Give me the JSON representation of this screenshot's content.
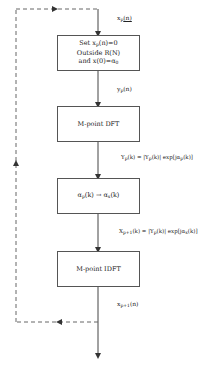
{
  "diagram": {
    "type": "flowchart",
    "boxes": [
      {
        "id": "constraint",
        "lines": [
          "Set x_p(n)=0",
          "Outside R(N)",
          "and x(0)=α_0"
        ]
      },
      {
        "id": "dft",
        "lines": [
          "M-point DFT"
        ]
      },
      {
        "id": "phase",
        "lines": [
          "α_p(k) → α_x(k)"
        ]
      },
      {
        "id": "idft",
        "lines": [
          "M-point IDFT"
        ]
      }
    ],
    "edges": [
      {
        "from": "input",
        "to": "constraint",
        "label": "x_p(n)"
      },
      {
        "from": "constraint",
        "to": "dft",
        "label": "y_p(n)"
      },
      {
        "from": "dft",
        "to": "phase",
        "label": "Y_p(k) = |Y_p(k)| exp[jα_p(k)]"
      },
      {
        "from": "phase",
        "to": "idft",
        "label": "X_{p+1}(k) = |Y_p(k)| exp[jα_x(k)]"
      },
      {
        "from": "idft",
        "to": "output",
        "label": "x_{p+1}(n)"
      },
      {
        "from": "output",
        "to": "input",
        "style": "dashed",
        "label": ""
      }
    ]
  },
  "labels": {
    "box1_line1_pre": "Set x",
    "box1_line1_sub": "p",
    "box1_line1_post": "(n)=0",
    "box1_line2": "Outside R(N)",
    "box1_line3_pre": "and x(0)=α",
    "box1_line3_sub": "0",
    "box2": "M-point DFT",
    "box3_a": "α",
    "box3_a_sub": "p",
    "box3_mid": "(k) → α",
    "box3_b_sub": "x",
    "box3_post": "(k)",
    "box4": "M-point IDFT",
    "edge1_pre": "x",
    "edge1_sub": "p",
    "edge1_post": "(n)",
    "edge2_pre": "y",
    "edge2_sub": "p",
    "edge2_post": "(n)",
    "edge3": "Y_p(k) = |Y_p(k)| exp[jα_p(k)]",
    "edge4": "X_{p+1}(k) = |Y_p(k)| exp[jα_x(k)]",
    "edge5_pre": "x",
    "edge5_sub": "p+1",
    "edge5_post": "(n)"
  }
}
